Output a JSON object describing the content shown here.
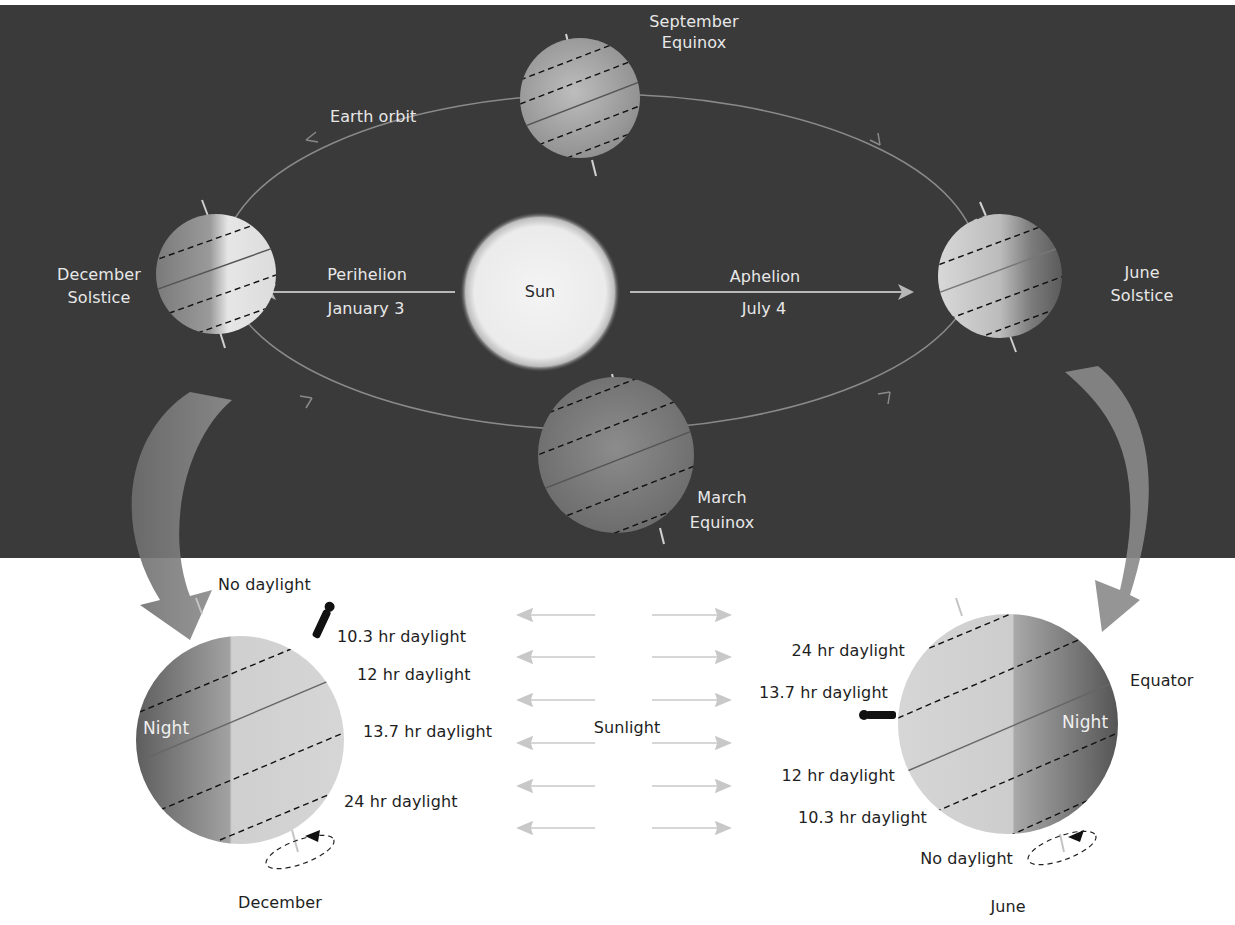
{
  "diagram": {
    "type": "earth-orbit-seasons",
    "colors": {
      "space_background": "#3a3a3a",
      "page_background": "#ffffff",
      "sun": "#efefef",
      "orbit_line": "#8a8a8a",
      "globe_day": "#cfcfcf",
      "globe_night": "#6e6e6e",
      "sunlight_arrow": "#c8c8c8",
      "big_arrow": "#8c8c8c"
    },
    "orbit": {
      "label": "Earth orbit",
      "sun_label": "Sun",
      "perihelion": {
        "label": "Perihelion",
        "date": "January 3"
      },
      "aphelion": {
        "label": "Aphelion",
        "date": "July 4"
      },
      "positions": [
        {
          "id": "september",
          "line1": "September",
          "line2": "Equinox"
        },
        {
          "id": "december",
          "line1": "December",
          "line2": "Solstice"
        },
        {
          "id": "june",
          "line1": "June",
          "line2": "Solstice"
        },
        {
          "id": "march",
          "line1": "March",
          "line2": "Equinox"
        }
      ]
    },
    "detail": {
      "sunlight_label": "Sunlight",
      "december": {
        "caption": "December",
        "night_label": "Night",
        "latitudes": [
          "No daylight",
          "10.3 hr daylight",
          "12 hr daylight",
          "13.7 hr daylight",
          "24 hr daylight"
        ]
      },
      "june": {
        "caption": "June",
        "night_label": "Night",
        "equator_label": "Equator",
        "latitudes": [
          "24 hr daylight",
          "13.7 hr daylight",
          "12 hr daylight",
          "10.3 hr daylight",
          "No daylight"
        ]
      }
    }
  }
}
